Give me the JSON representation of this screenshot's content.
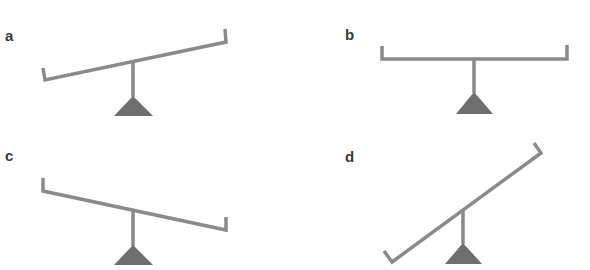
{
  "figure": {
    "colors": {
      "beam": "#8a8a8a",
      "fulcrum": "#6e6e6e",
      "label": "#3a3a3a",
      "background": "#ffffff"
    },
    "panels": [
      {
        "label": "a",
        "state": "tilted-left-down",
        "label_pos": [
          5,
          28
        ],
        "beam": [
          [
            43,
            68
          ],
          [
            45,
            80
          ],
          [
            226,
            42
          ],
          [
            225,
            29
          ]
        ],
        "post": [
          [
            133,
            61
          ],
          [
            133,
            97
          ]
        ],
        "fulcrum": [
          [
            133,
            96
          ],
          [
            114,
            116
          ],
          [
            153,
            116
          ]
        ]
      },
      {
        "label": "b",
        "state": "balanced",
        "label_pos": [
          345,
          27
        ],
        "beam": [
          [
            382,
            46
          ],
          [
            382,
            59
          ],
          [
            567,
            59
          ],
          [
            567,
            45
          ]
        ],
        "post": [
          [
            474,
            59
          ],
          [
            474,
            93
          ]
        ],
        "fulcrum": [
          [
            474,
            92
          ],
          [
            456,
            114
          ],
          [
            493,
            114
          ]
        ]
      },
      {
        "label": "c",
        "state": "tilted-right-down",
        "label_pos": [
          5,
          148
        ],
        "beam": [
          [
            43,
            178
          ],
          [
            43,
            191
          ],
          [
            226,
            230
          ],
          [
            226,
            217
          ]
        ],
        "post": [
          [
            133,
            210
          ],
          [
            133,
            246
          ]
        ],
        "fulcrum": [
          [
            133,
            245
          ],
          [
            114,
            265
          ],
          [
            153,
            265
          ]
        ]
      },
      {
        "label": "d",
        "state": "steeply-tilted-left-down",
        "label_pos": [
          345,
          149
        ],
        "beam": [
          [
            384,
            251
          ],
          [
            392,
            262
          ],
          [
            541,
            153
          ],
          [
            534,
            143
          ]
        ],
        "post": [
          [
            463,
            210
          ],
          [
            463,
            244
          ]
        ],
        "fulcrum": [
          [
            463,
            243
          ],
          [
            445,
            264
          ],
          [
            482,
            264
          ]
        ]
      }
    ]
  }
}
